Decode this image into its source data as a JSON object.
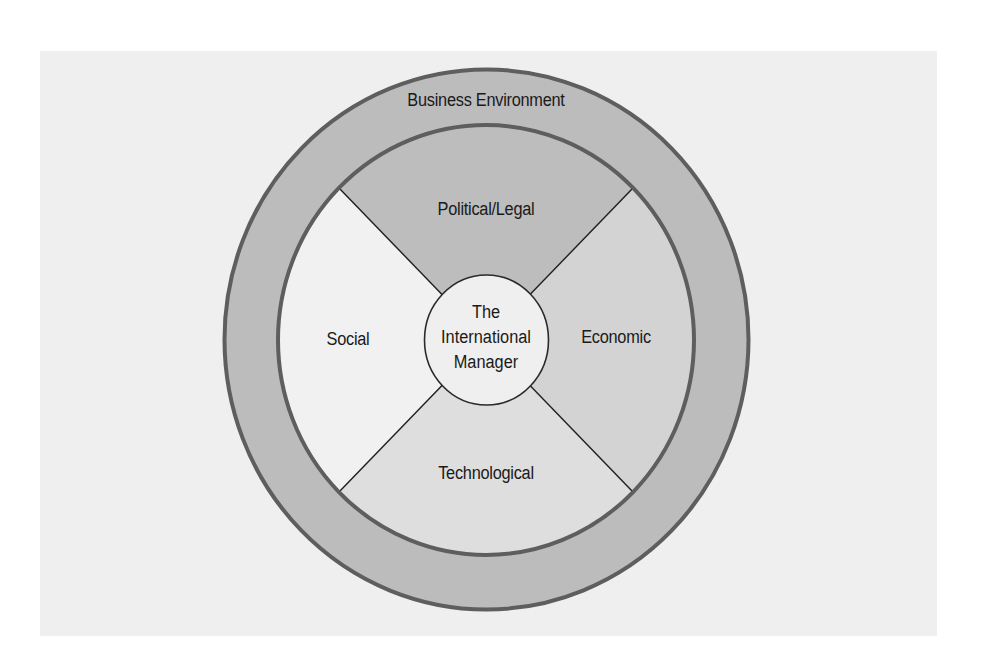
{
  "diagram": {
    "type": "concentric-environment-diagram",
    "outer_ring": {
      "label": "Business Environment",
      "fill": "#bcbcbc",
      "stroke": "#5e5e5e"
    },
    "quadrants": [
      {
        "id": "top",
        "label": "Political/Legal",
        "fill": "#bdbdbd"
      },
      {
        "id": "right",
        "label": "Economic",
        "fill": "#d3d3d3"
      },
      {
        "id": "bottom",
        "label": "Technological",
        "fill": "#dedede"
      },
      {
        "id": "left",
        "label": "Social",
        "fill": "#f1f1f1"
      }
    ],
    "center": {
      "lines": [
        "The",
        "International",
        "Manager"
      ],
      "fill": "#efefef",
      "stroke": "#2a2a2a"
    },
    "background_panel_color": "#efefef",
    "divider_color": "#1e1e1e"
  }
}
